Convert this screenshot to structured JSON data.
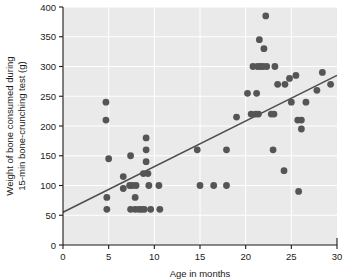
{
  "chart_data": {
    "type": "scatter",
    "title": "",
    "xlabel": "Age in months",
    "ylabel": "Weight of bone consumed during 15-min bone-crunching test (g)",
    "ylabel_line1": "Weight of bone consumed during",
    "ylabel_line2": "15-min bone-crunching test (g)",
    "xlim": [
      0,
      30
    ],
    "ylim": [
      0,
      400
    ],
    "xticks": [
      0,
      5,
      10,
      15,
      20,
      25,
      30
    ],
    "xtick_labels": [
      "0",
      "5",
      "10",
      "15",
      "20",
      "25",
      "30"
    ],
    "yticks": [
      0,
      50,
      100,
      150,
      200,
      250,
      300,
      350,
      400
    ],
    "ytick_labels": [
      "0",
      "50",
      "100",
      "150",
      "200",
      "250",
      "300",
      "350",
      "400"
    ],
    "grid": true,
    "grid_color": "#ffffff",
    "plot_background": "#eaeaea",
    "point_color": "#555555",
    "point_radius": 3.4,
    "line_color": "#4d4d4d",
    "legend": "none",
    "points": [
      [
        4.7,
        240
      ],
      [
        4.7,
        210
      ],
      [
        5.0,
        145
      ],
      [
        4.8,
        80
      ],
      [
        4.8,
        60
      ],
      [
        7.4,
        150
      ],
      [
        6.6,
        115
      ],
      [
        6.6,
        95
      ],
      [
        7.3,
        100
      ],
      [
        7.6,
        100
      ],
      [
        8.0,
        100
      ],
      [
        7.4,
        60
      ],
      [
        7.9,
        80
      ],
      [
        7.9,
        60
      ],
      [
        8.3,
        60
      ],
      [
        8.6,
        60
      ],
      [
        8.9,
        60
      ],
      [
        9.1,
        180
      ],
      [
        9.1,
        160
      ],
      [
        9.1,
        140
      ],
      [
        8.8,
        120
      ],
      [
        9.3,
        120
      ],
      [
        9.4,
        100
      ],
      [
        9.6,
        60
      ],
      [
        10.5,
        100
      ],
      [
        10.6,
        60
      ],
      [
        14.7,
        160
      ],
      [
        15.0,
        100
      ],
      [
        16.5,
        100
      ],
      [
        17.9,
        100
      ],
      [
        17.9,
        160
      ],
      [
        19.0,
        215
      ],
      [
        20.2,
        255
      ],
      [
        20.8,
        300
      ],
      [
        21.3,
        300
      ],
      [
        21.6,
        300
      ],
      [
        21.9,
        300
      ],
      [
        21.2,
        255
      ],
      [
        20.6,
        220
      ],
      [
        21.1,
        220
      ],
      [
        21.4,
        220
      ],
      [
        22.3,
        300
      ],
      [
        23.2,
        300
      ],
      [
        22.2,
        385
      ],
      [
        22.0,
        330
      ],
      [
        21.5,
        345
      ],
      [
        22.8,
        220
      ],
      [
        23.1,
        220
      ],
      [
        23.0,
        160
      ],
      [
        24.2,
        125
      ],
      [
        23.5,
        270
      ],
      [
        24.3,
        270
      ],
      [
        24.8,
        280
      ],
      [
        25.5,
        285
      ],
      [
        25.0,
        240
      ],
      [
        25.7,
        210
      ],
      [
        26.1,
        210
      ],
      [
        26.1,
        195
      ],
      [
        26.6,
        240
      ],
      [
        25.8,
        90
      ],
      [
        27.8,
        260
      ],
      [
        28.4,
        290
      ],
      [
        29.3,
        270
      ]
    ],
    "trend_line": {
      "x0": 0,
      "y0": 55,
      "x1": 30,
      "y1": 285
    }
  }
}
